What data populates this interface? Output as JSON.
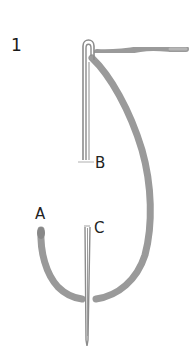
{
  "diagram": {
    "step_number": "1",
    "labels": {
      "a": "A",
      "b": "B",
      "c": "C"
    },
    "colors": {
      "thread": "#9a9a9a",
      "thread_dark": "#7d7d7d",
      "needle": "#8c8c8c",
      "text": "#222222"
    }
  }
}
